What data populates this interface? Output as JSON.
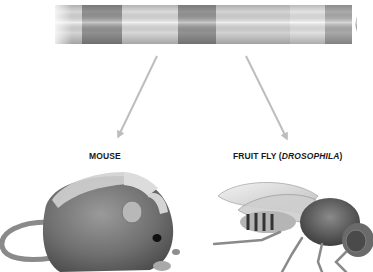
{
  "diagram": {
    "chromosome": {
      "bands": [
        {
          "x0": 55,
          "x1": 82,
          "shade": "#e2e2e2"
        },
        {
          "x0": 82,
          "x1": 122,
          "shade": "#9a9a9a"
        },
        {
          "x0": 122,
          "x1": 178,
          "shade": "#e6e6e6"
        },
        {
          "x0": 178,
          "x1": 216,
          "shade": "#9c9c9c"
        },
        {
          "x0": 216,
          "x1": 290,
          "shade": "#e0e0e0"
        },
        {
          "x0": 290,
          "x1": 325,
          "shade": "#efefef"
        },
        {
          "x0": 325,
          "x1": 357,
          "shade": "#b4b4b4"
        }
      ]
    },
    "arrows": [
      {
        "name": "arrow-to-mouse",
        "from": [
          157,
          56
        ],
        "to": [
          119,
          135
        ]
      },
      {
        "name": "arrow-to-fruit-fly",
        "from": [
          246,
          56
        ],
        "to": [
          286,
          137
        ]
      }
    ],
    "labels": {
      "mouse": "MOUSE",
      "fruit_fly_prefix": "FRUIT FLY (",
      "fruit_fly_genus": "DROSOPHILA",
      "fruit_fly_suffix": ")"
    },
    "colors": {
      "arrow": "#bdbdbd",
      "label": "#1a1a1a",
      "highlight_segment": "#d8d8d8"
    }
  }
}
